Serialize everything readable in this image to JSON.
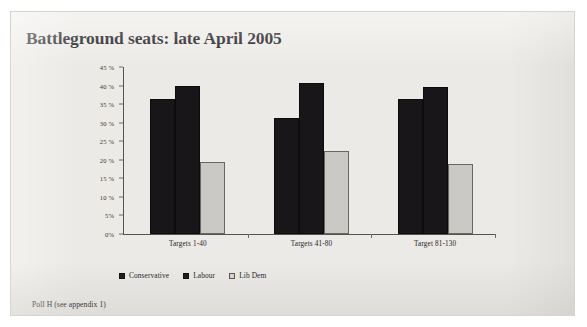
{
  "figure": {
    "title": "Battleground seats: late April 2005",
    "caption": "Poll H (see appendix 1)",
    "background_color": "#eceae6"
  },
  "chart_data": {
    "type": "bar",
    "title": "Battleground seats: late April 2005",
    "xlabel": "",
    "ylabel": "",
    "categories": [
      "Targets 1-40",
      "Targets 41-80",
      "Target 81-130"
    ],
    "series": [
      {
        "name": "Conservative",
        "color": "#181618",
        "values": [
          36.4,
          31.2,
          36.4
        ]
      },
      {
        "name": "Labour",
        "color": "#181618",
        "values": [
          40.0,
          40.8,
          39.6
        ]
      },
      {
        "name": "Lib Dem",
        "color": "#cbc9c6",
        "values": [
          19.5,
          22.3,
          18.9
        ]
      }
    ],
    "ylim": [
      0,
      45
    ],
    "ytick_values": [
      45,
      40,
      35,
      30,
      25,
      20,
      15,
      10,
      5,
      0
    ],
    "ytick_labels": [
      "45 %",
      "40 %",
      "35 %",
      "30 %",
      "25 %",
      "20 %",
      "15 %",
      "10 %",
      "5%",
      "0%"
    ],
    "grid": false,
    "legend_position": "bottom",
    "value_format": "percent"
  },
  "legend": {
    "items": [
      {
        "label": "Conservative",
        "swatch": "conservative"
      },
      {
        "label": "Labour",
        "swatch": "labour"
      },
      {
        "label": "Lib Dem",
        "swatch": "libdem"
      }
    ]
  }
}
